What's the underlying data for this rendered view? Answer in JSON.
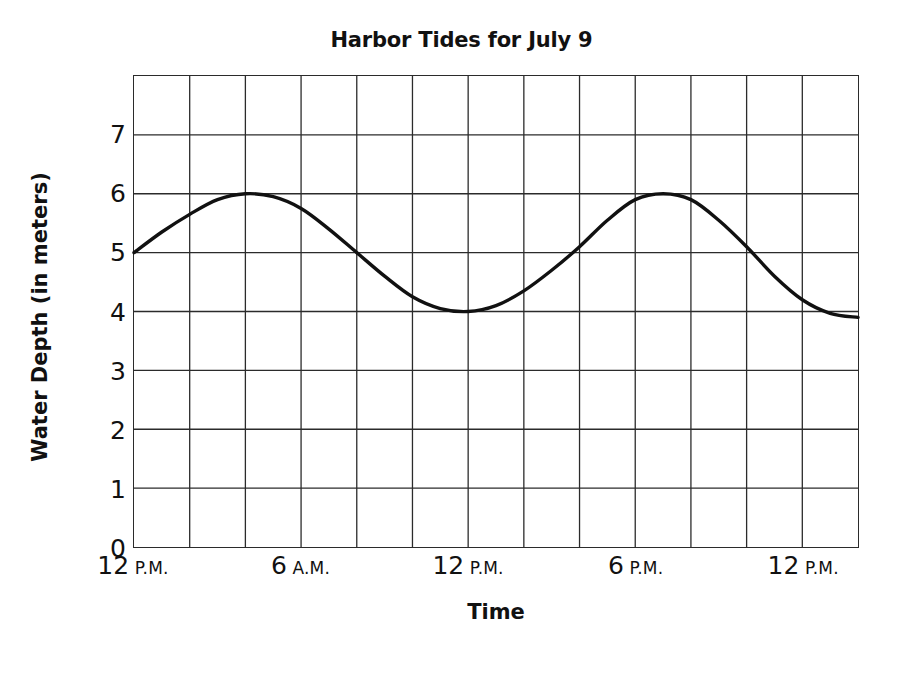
{
  "chart_data": {
    "type": "line",
    "title": "Harbor Tides for July 9",
    "xlabel": "Time",
    "ylabel": "Water Depth (in meters)",
    "ylim": [
      0,
      8
    ],
    "xlim": [
      0,
      26
    ],
    "grid": true,
    "legend": null,
    "y_ticks": [
      "7",
      "6",
      "5",
      "4",
      "3",
      "2",
      "1",
      "0"
    ],
    "y_tick_values": [
      7,
      6,
      5,
      4,
      3,
      2,
      1,
      0
    ],
    "x_ticks": [
      {
        "number": "12",
        "suffix": "P.M.",
        "hour": 0
      },
      {
        "number": "6",
        "suffix": "A.M.",
        "hour": 6
      },
      {
        "number": "12",
        "suffix": "P.M.",
        "hour": 12
      },
      {
        "number": "6",
        "suffix": "P.M.",
        "hour": 18
      },
      {
        "number": "12",
        "suffix": "P.M.",
        "hour": 24
      }
    ],
    "x_gridline_step_hours": 2,
    "x_gridline_count": 13,
    "series": [
      {
        "name": "Water depth",
        "color": "#111111",
        "x": [
          0,
          1,
          2,
          3,
          4,
          5,
          6,
          7,
          8,
          9,
          10,
          11,
          12,
          13,
          14,
          15,
          16,
          17,
          18,
          19,
          20,
          21,
          22,
          23,
          24,
          25,
          26
        ],
        "values": [
          5.0,
          5.35,
          5.65,
          5.9,
          6.0,
          5.95,
          5.75,
          5.4,
          5.0,
          4.6,
          4.25,
          4.05,
          4.0,
          4.1,
          4.35,
          4.7,
          5.1,
          5.55,
          5.9,
          6.0,
          5.9,
          5.55,
          5.1,
          4.6,
          4.2,
          3.97,
          3.9
        ]
      }
    ],
    "annotations": {
      "start_value": 5.0,
      "first_peak": {
        "hour": 4,
        "value": 6.0
      },
      "trough": {
        "hour": 11,
        "value": 4.0
      },
      "second_peak": {
        "hour": 18,
        "value": 6.0
      },
      "end_value": 3.9
    }
  }
}
